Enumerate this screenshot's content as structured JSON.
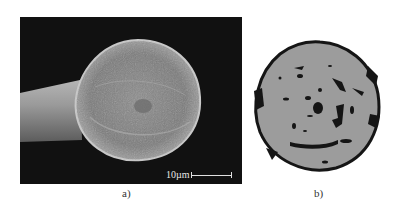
{
  "figure": {
    "panels": [
      {
        "id": "a",
        "caption": "a)",
        "description": "SEM micrograph of fiber cross-section end view",
        "scale_bar": {
          "label": "10µm"
        }
      },
      {
        "id": "b",
        "caption": "b)",
        "description": "Binarized cross-section showing voids (black) within gray fiber area"
      }
    ],
    "colors": {
      "sem_background": "#111111",
      "fiber_gray": "#9a9a9a",
      "void_black": "#111111",
      "page_background": "#ffffff"
    }
  }
}
